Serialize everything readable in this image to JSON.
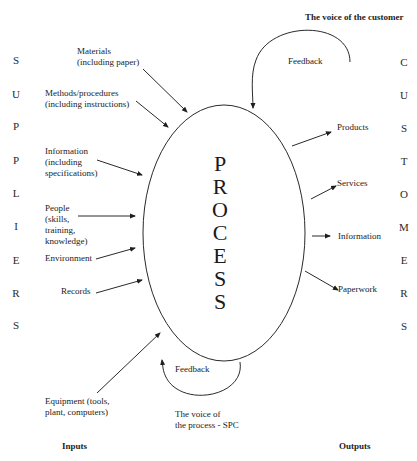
{
  "diagram": {
    "type": "process-model",
    "center_label_letters": [
      "P",
      "R",
      "O",
      "C",
      "E",
      "S",
      "S"
    ],
    "center_label": "PROCESS",
    "suppliers_letters": [
      "S",
      "U",
      "P",
      "P",
      "L",
      "I",
      "E",
      "R",
      "S"
    ],
    "suppliers_label": "SUPPLIERS",
    "customers_letters": [
      "C",
      "U",
      "S",
      "T",
      "O",
      "M",
      "E",
      "R",
      "S"
    ],
    "customers_label": "CUSTOMERS",
    "inputs": [
      {
        "id": "materials",
        "label": "Materials\n(including paper)"
      },
      {
        "id": "methods",
        "label": "Methods/procedures\n(including instructions)"
      },
      {
        "id": "information",
        "label": "Information\n(including\nspecifications)"
      },
      {
        "id": "people",
        "label": "People\n(skills,\ntraining,\nknowledge)"
      },
      {
        "id": "environment",
        "label": "Environment"
      },
      {
        "id": "records",
        "label": "Records"
      },
      {
        "id": "equipment",
        "label": "Equipment (tools,\nplant, computers)"
      }
    ],
    "outputs": [
      {
        "id": "products",
        "label": "Products"
      },
      {
        "id": "services",
        "label": "Services"
      },
      {
        "id": "information",
        "label": "Information"
      },
      {
        "id": "paperwork",
        "label": "Paperwork"
      }
    ],
    "feedback_top": {
      "label": "Feedback",
      "caption": "The voice of the customer"
    },
    "feedback_bottom": {
      "label": "Feedback",
      "caption": "The voice of\nthe process - SPC"
    },
    "footer": {
      "inputs_label": "Inputs",
      "outputs_label": "Outputs"
    },
    "colors": {
      "stroke": "#2a2a2a",
      "text": "#222222",
      "background": "#ffffff"
    }
  }
}
